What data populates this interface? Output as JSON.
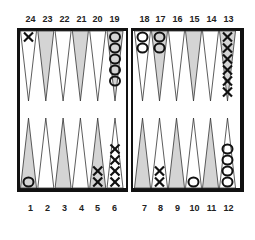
{
  "board": {
    "title": "Backgammon board",
    "colors": {
      "frame": "#111111",
      "shaded_point": "#d4d4d4",
      "plain_point": "#ffffff",
      "checker_stroke": "#111111"
    },
    "top_labels": [
      "24",
      "23",
      "22",
      "21",
      "20",
      "19",
      "18",
      "17",
      "16",
      "15",
      "14",
      "13"
    ],
    "bottom_labels": [
      "1",
      "2",
      "3",
      "4",
      "5",
      "6",
      "7",
      "8",
      "9",
      "10",
      "11",
      "12"
    ],
    "points": [
      {
        "point": 1,
        "player": "O",
        "count": 1
      },
      {
        "point": 5,
        "player": "X",
        "count": 2
      },
      {
        "point": 6,
        "player": "X",
        "count": 4
      },
      {
        "point": 8,
        "player": "X",
        "count": 2
      },
      {
        "point": 10,
        "player": "O",
        "count": 1
      },
      {
        "point": 12,
        "player": "O",
        "count": 4
      },
      {
        "point": 13,
        "player": "X",
        "count": 6
      },
      {
        "point": 17,
        "player": "O",
        "count": 2
      },
      {
        "point": 18,
        "player": "O",
        "count": 2
      },
      {
        "point": 19,
        "player": "O",
        "count": 5
      },
      {
        "point": 24,
        "player": "X",
        "count": 1
      }
    ]
  }
}
